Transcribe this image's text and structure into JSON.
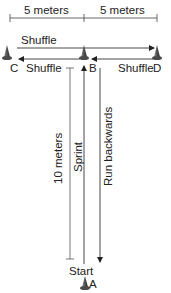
{
  "diagram": {
    "dimensions": {
      "left_label": "5 meters",
      "right_label": "5 meters",
      "vertical_label": "10 meters"
    },
    "cones": [
      {
        "id": "C",
        "label": "C"
      },
      {
        "id": "B",
        "label": "B"
      },
      {
        "id": "D",
        "label": "D"
      },
      {
        "id": "A",
        "label": "A"
      }
    ],
    "arrows": {
      "top_shuffle": "Shuffle",
      "left_shuffle": "Shuffle",
      "right_shuffle": "Shuffle",
      "sprint": "Sprint",
      "run_backwards": "Run backwards"
    },
    "start_label": "Start",
    "colors": {
      "line": "#333333",
      "cone_dark": "#3a3a3a",
      "cone_light": "#8a8a8a"
    }
  }
}
